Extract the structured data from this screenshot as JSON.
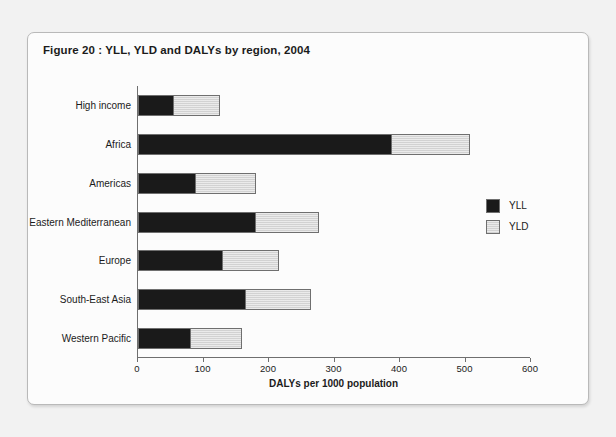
{
  "figure": {
    "caption": "Figure 20 : YLL, YLD and DALYs by region, 2004"
  },
  "legend": {
    "position": "right",
    "items": [
      {
        "label": "YLL",
        "color": "#1a1a1a"
      },
      {
        "label": "YLD",
        "color": "#d2d2d2"
      }
    ]
  },
  "axis": {
    "x_title": "DALYs per 1000 population",
    "x_ticks": [
      "0",
      "100",
      "200",
      "300",
      "400",
      "500",
      "600"
    ]
  },
  "chart_data": {
    "type": "bar",
    "orientation": "horizontal",
    "stacked": true,
    "title": "Figure 20 : YLL, YLD and DALYs by region, 2004",
    "xlabel": "DALYs per 1000 population",
    "ylabel": "",
    "xlim": [
      0,
      600
    ],
    "xticks": [
      0,
      100,
      200,
      300,
      400,
      500,
      600
    ],
    "grid": false,
    "legend_position": "right",
    "categories": [
      "High income",
      "Africa",
      "Americas",
      "Eastern Mediterranean",
      "Europe",
      "South-East Asia",
      "Western Pacific"
    ],
    "series": [
      {
        "name": "YLL",
        "color": "#1a1a1a",
        "values": [
          54,
          386,
          87,
          179,
          129,
          164,
          80
        ]
      },
      {
        "name": "YLD",
        "color": "#d2d2d2",
        "values": [
          71,
          121,
          93,
          97,
          87,
          100,
          79
        ]
      }
    ],
    "totals": [
      125,
      507,
      180,
      276,
      216,
      264,
      159
    ]
  }
}
